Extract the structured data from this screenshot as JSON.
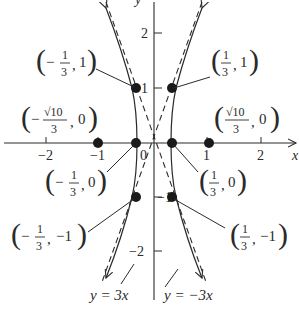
{
  "figure": {
    "type": "hyperbola graph",
    "equation_asymptotes": [
      "y = 3x",
      "y = -3x"
    ],
    "colors": {
      "ink": "#2a2a2a",
      "background": "#ffffff"
    }
  },
  "axes": {
    "x_label": "x",
    "y_label": "y",
    "x_ticks": [
      {
        "value": -2,
        "label": "−2"
      },
      {
        "value": -1,
        "label": "−1"
      },
      {
        "value": 1,
        "label": "1"
      },
      {
        "value": 2,
        "label": "2"
      }
    ],
    "y_ticks": [
      {
        "value": 2,
        "label": "2"
      },
      {
        "value": 1,
        "label": "1"
      },
      {
        "value": -1,
        "label": "−1"
      },
      {
        "value": -2,
        "label": "−2"
      }
    ],
    "origin_label": "0"
  },
  "points": [
    {
      "x": -0.3333,
      "y": 1,
      "label": "(−⅓, 1)",
      "num": "1",
      "den": "3",
      "sign": "−",
      "second": "1"
    },
    {
      "x": 0.3333,
      "y": 1,
      "label": "(⅓, 1)",
      "num": "1",
      "den": "3",
      "sign": "",
      "second": "1"
    },
    {
      "x": -1.054,
      "y": 0,
      "label": "(−√10/3, 0)",
      "num": "√10",
      "den": "3",
      "sign": "−",
      "second": "0"
    },
    {
      "x": 1.054,
      "y": 0,
      "label": "(√10/3, 0)",
      "num": "√10",
      "den": "3",
      "sign": "",
      "second": "0"
    },
    {
      "x": -0.3333,
      "y": 0,
      "label": "(−⅓, 0)",
      "num": "1",
      "den": "3",
      "sign": "−",
      "second": "0"
    },
    {
      "x": 0.3333,
      "y": 0,
      "label": "(⅓, 0)",
      "num": "1",
      "den": "3",
      "sign": "",
      "second": "0"
    },
    {
      "x": -0.3333,
      "y": -1,
      "label": "(−⅓, −1)",
      "num": "1",
      "den": "3",
      "sign": "−",
      "second": "−1"
    },
    {
      "x": 0.3333,
      "y": -1,
      "label": "(⅓, −1)",
      "num": "1",
      "den": "3",
      "sign": "",
      "second": "−1"
    }
  ],
  "asymptote_labels": {
    "left": "y = 3x",
    "right": "y = −3x"
  }
}
